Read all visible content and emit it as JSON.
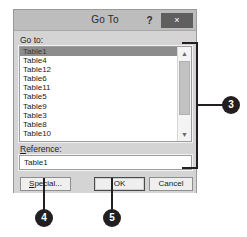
{
  "dialog": {
    "title": "Go To",
    "help_label": "?",
    "close_label": "×",
    "goto_label_prefix": "",
    "goto_label": "Go to:",
    "reference_label_accel": "R",
    "reference_label_rest": "eference:",
    "reference_value": "Table1",
    "list_items": [
      "Table1",
      "Table4",
      "Table12",
      "Table6",
      "Table11",
      "Table5",
      "Table9",
      "Table3",
      "Table8",
      "Table10"
    ],
    "selected_item": "Table1",
    "scroll_up_glyph": "▲",
    "scroll_down_glyph": "▼",
    "buttons": {
      "special_accel": "S",
      "special_rest": "pecial...",
      "ok": "OK",
      "cancel": "Cancel"
    }
  },
  "callouts": [
    {
      "number": "3"
    },
    {
      "number": "4"
    },
    {
      "number": "5"
    }
  ],
  "colors": {
    "dialog_face": "#d4d4d4",
    "titlebar": "#bdbdbd",
    "close_button": "#5f5f5f",
    "selection": "#8c8c8c",
    "callout": "#231f20"
  }
}
